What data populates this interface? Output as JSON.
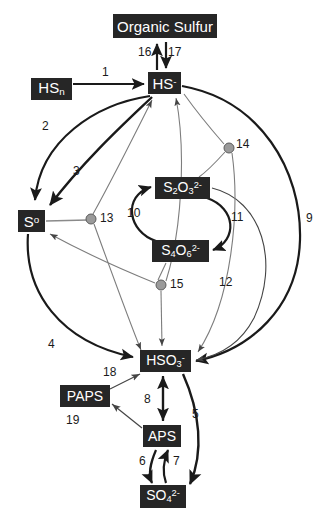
{
  "diagram": {
    "type": "sulfur-cycle-pathway",
    "background_color": "#ffffff",
    "node_fill_color": "#262626",
    "node_text_color": "#ffffff",
    "edge_color": "#1a1a1a",
    "junction_color": "#9a9a9a",
    "nodes": [
      {
        "id": "organic_sulfur",
        "label": "Organic Sulfur",
        "html": "Organic Sulfur",
        "x": 113,
        "y": 14,
        "w": 104,
        "h": 24,
        "font_size": 15
      },
      {
        "id": "hs_n",
        "label": "HSn",
        "html": "HS<sub>n</sub>",
        "x": 31,
        "y": 78,
        "w": 41,
        "h": 22,
        "font_size": 15
      },
      {
        "id": "hs_minus",
        "label": "HS-",
        "html": "HS<sup>-</sup>",
        "x": 148,
        "y": 72,
        "w": 33,
        "h": 22,
        "font_size": 15
      },
      {
        "id": "s_zero",
        "label": "S0",
        "html": "S<sup>o</sup>",
        "x": 18,
        "y": 210,
        "w": 27,
        "h": 22,
        "font_size": 15
      },
      {
        "id": "s2o3",
        "label": "S2O3 2-",
        "html": "S<sub>2</sub>O<sub>3</sub><sup>2-</sup>",
        "x": 155,
        "y": 177,
        "w": 55,
        "h": 22,
        "font_size": 14
      },
      {
        "id": "s4o6",
        "label": "S4O6 2-",
        "html": "S<sub>4</sub>O<sub>6</sub><sup>2-</sup>",
        "x": 152,
        "y": 240,
        "w": 57,
        "h": 22,
        "font_size": 14
      },
      {
        "id": "hso3",
        "label": "HSO3 -",
        "html": "HSO<sub>3</sub><sup>-</sup>",
        "x": 140,
        "y": 350,
        "w": 51,
        "h": 22,
        "font_size": 14
      },
      {
        "id": "paps",
        "label": "PAPS",
        "html": "PAPS",
        "x": 60,
        "y": 385,
        "w": 50,
        "h": 22,
        "font_size": 14
      },
      {
        "id": "aps",
        "label": "APS",
        "html": "APS",
        "x": 143,
        "y": 425,
        "w": 38,
        "h": 22,
        "font_size": 14
      },
      {
        "id": "so4",
        "label": "SO4 2-",
        "html": "SO<sub>4</sub><sup>2-</sup>",
        "x": 140,
        "y": 485,
        "w": 46,
        "h": 23,
        "font_size": 14
      }
    ],
    "junctions": [
      {
        "id": "j13",
        "label": "13",
        "cx": 91,
        "cy": 219,
        "r": 5
      },
      {
        "id": "j14",
        "label": "14",
        "cx": 229,
        "cy": 148,
        "r": 5
      },
      {
        "id": "j15",
        "label": "15",
        "cx": 161,
        "cy": 285,
        "r": 5
      }
    ],
    "edge_labels": [
      {
        "id": "e1",
        "text": "1",
        "x": 102,
        "y": 73
      },
      {
        "id": "e2",
        "text": "2",
        "x": 42,
        "y": 120
      },
      {
        "id": "e3",
        "text": "3",
        "x": 73,
        "y": 168
      },
      {
        "id": "e4",
        "text": "4",
        "x": 48,
        "y": 340
      },
      {
        "id": "e5",
        "text": "5",
        "x": 192,
        "y": 414
      },
      {
        "id": "e6",
        "text": "6",
        "x": 140,
        "y": 461
      },
      {
        "id": "e7",
        "text": "7",
        "x": 172,
        "y": 461
      },
      {
        "id": "e8",
        "text": "8",
        "x": 143,
        "y": 399
      },
      {
        "id": "e9",
        "text": "9",
        "x": 307,
        "y": 219
      },
      {
        "id": "e10",
        "text": "10",
        "x": 128,
        "y": 213
      },
      {
        "id": "e11",
        "text": "11",
        "x": 231,
        "y": 218
      },
      {
        "id": "e12",
        "text": "12",
        "x": 219,
        "y": 283
      },
      {
        "id": "e13",
        "text": "13",
        "x": 100,
        "y": 214
      },
      {
        "id": "e14",
        "text": "14",
        "x": 236,
        "y": 141
      },
      {
        "id": "e15",
        "text": "15",
        "x": 170,
        "y": 280
      },
      {
        "id": "e16",
        "text": "16",
        "x": 140,
        "y": 49
      },
      {
        "id": "e17",
        "text": "17",
        "x": 167,
        "y": 49
      },
      {
        "id": "e18",
        "text": "18",
        "x": 104,
        "y": 371
      },
      {
        "id": "e19",
        "text": "19",
        "x": 67,
        "y": 418
      }
    ],
    "edges": [
      {
        "id": "edge-1",
        "label": "1",
        "from": "hs_n",
        "to": "hs_minus",
        "style": "bold-straight"
      },
      {
        "id": "edge-2",
        "label": "2",
        "from": "hs_minus",
        "to": "s_zero",
        "style": "bold-arc-left"
      },
      {
        "id": "edge-3",
        "label": "3",
        "from": "s_zero",
        "to": "hs_minus",
        "style": "bold-arc"
      },
      {
        "id": "edge-4",
        "label": "4",
        "from": "s_zero",
        "to": "hso3",
        "style": "bold-arc-left"
      },
      {
        "id": "edge-5",
        "label": "5",
        "from": "hso3",
        "to": "so4",
        "style": "bold-arc"
      },
      {
        "id": "edge-6",
        "label": "6",
        "from": "aps",
        "to": "so4",
        "style": "bold-arc"
      },
      {
        "id": "edge-7",
        "label": "7",
        "from": "so4",
        "to": "aps",
        "style": "bold-arc"
      },
      {
        "id": "edge-8",
        "label": "8",
        "from": "hso3",
        "to": "aps",
        "style": "bold-double"
      },
      {
        "id": "edge-9",
        "label": "9",
        "from": "hs_minus",
        "to": "hso3",
        "style": "bold-arc-right"
      },
      {
        "id": "edge-10",
        "label": "10",
        "from": "s4o6",
        "to": "s2o3",
        "style": "bold-loop-left"
      },
      {
        "id": "edge-11",
        "label": "11",
        "from": "s2o3",
        "to": "s4o6",
        "style": "bold-loop-right"
      },
      {
        "id": "edge-12",
        "label": "12",
        "from": "s2o3",
        "to": "hso3",
        "style": "thin-arc-right"
      },
      {
        "id": "edge-13",
        "label": "13",
        "from": "s_zero",
        "to": "j13",
        "style": "thin-junction"
      },
      {
        "id": "edge-14",
        "label": "14",
        "from": "hs_minus",
        "to": "j14",
        "style": "thin-junction"
      },
      {
        "id": "edge-15",
        "label": "15",
        "from": "s4o6",
        "to": "j15",
        "style": "thin-junction"
      },
      {
        "id": "edge-16",
        "label": "16",
        "from": "hs_minus",
        "to": "organic_sulfur",
        "style": "bold-up"
      },
      {
        "id": "edge-17",
        "label": "17",
        "from": "organic_sulfur",
        "to": "hs_minus",
        "style": "bold-down"
      },
      {
        "id": "edge-18",
        "label": "18",
        "from": "paps",
        "to": "hso3",
        "style": "thin-straight"
      },
      {
        "id": "edge-19",
        "label": "19",
        "from": "aps",
        "to": "paps",
        "style": "thin-straight"
      }
    ]
  }
}
